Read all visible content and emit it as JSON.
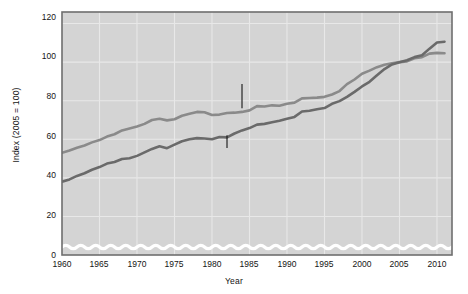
{
  "chart_data": {
    "type": "line",
    "title": "",
    "xlabel": "Year",
    "ylabel": "Index (2005 = 100)",
    "xlim": [
      1960,
      2012
    ],
    "ylim": [
      0,
      126
    ],
    "grid": true,
    "legend_position": "inline-annotations",
    "axis_break": "wavy break between 0 and lowest data",
    "y_ticks": [
      "0",
      "20",
      "40",
      "60",
      "80",
      "100",
      "120"
    ],
    "y_tick_values": [
      0,
      20,
      40,
      60,
      80,
      100,
      120
    ],
    "x_ticks": [
      "1960",
      "1965",
      "1970",
      "1975",
      "1980",
      "1985",
      "1990",
      "1995",
      "2000",
      "2005",
      "2010"
    ],
    "x_tick_values": [
      1960,
      1965,
      1970,
      1975,
      1980,
      1985,
      1990,
      1995,
      2000,
      2005,
      2010
    ],
    "x": [
      1960,
      1961,
      1962,
      1963,
      1964,
      1965,
      1966,
      1967,
      1968,
      1969,
      1970,
      1971,
      1972,
      1973,
      1974,
      1975,
      1976,
      1977,
      1978,
      1979,
      1980,
      1981,
      1982,
      1983,
      1984,
      1985,
      1986,
      1987,
      1988,
      1989,
      1990,
      1991,
      1992,
      1993,
      1994,
      1995,
      1996,
      1997,
      1998,
      1999,
      2000,
      2001,
      2002,
      2003,
      2004,
      2005,
      2006,
      2007,
      2008,
      2009,
      2010,
      2011
    ],
    "series": [
      {
        "name": "Real hourly compensation",
        "color": "#8a8a8a",
        "values": [
          53.0,
          54.2,
          55.6,
          56.8,
          58.4,
          59.6,
          61.4,
          62.6,
          64.6,
          65.6,
          66.6,
          68.0,
          70.0,
          70.6,
          69.8,
          70.4,
          72.2,
          73.2,
          74.2,
          74.0,
          72.6,
          72.8,
          73.6,
          73.8,
          74.2,
          75.0,
          77.2,
          77.0,
          77.6,
          77.4,
          78.4,
          79.0,
          81.2,
          81.4,
          81.6,
          82.0,
          83.2,
          85.0,
          88.6,
          91.0,
          94.0,
          95.6,
          97.4,
          98.6,
          99.4,
          100.0,
          100.4,
          102.0,
          102.6,
          104.4,
          104.8,
          104.6
        ]
      },
      {
        "name": "Output per hour of work",
        "color": "#6a6a6a",
        "values": [
          38.0,
          39.2,
          41.0,
          42.4,
          44.2,
          45.6,
          47.4,
          48.2,
          49.8,
          50.2,
          51.4,
          53.2,
          55.0,
          56.4,
          55.4,
          57.2,
          59.0,
          60.0,
          60.6,
          60.4,
          60.0,
          61.2,
          61.0,
          63.0,
          64.6,
          65.8,
          67.6,
          68.0,
          68.8,
          69.6,
          70.6,
          71.6,
          74.4,
          74.8,
          75.6,
          76.2,
          78.4,
          79.8,
          82.0,
          84.6,
          87.4,
          89.8,
          93.2,
          96.4,
          98.8,
          100.0,
          101.0,
          102.6,
          103.6,
          107.0,
          110.2,
          110.6
        ]
      }
    ],
    "annotations": [
      {
        "name": "real-hourly-compensation",
        "line1": "Real hourly",
        "line2": "compensation",
        "text": "Real hourly compensation",
        "leader_target_year": 1984,
        "leader_target_value": 75
      },
      {
        "name": "output-per-hour-of-work",
        "line1": "Output per",
        "line2": "hour of work",
        "text": "Output per hour of work",
        "leader_target_year": 1982,
        "leader_target_value": 61
      }
    ],
    "colors": {
      "plot_background": "#d4d4d4",
      "page_background": "#ffffff",
      "grid": "#e8e8e8",
      "border": "#6e6e6e",
      "text": "#141414",
      "series_1": "#8a8a8a",
      "series_2": "#6a6a6a",
      "break_line": "#ffffff"
    }
  }
}
